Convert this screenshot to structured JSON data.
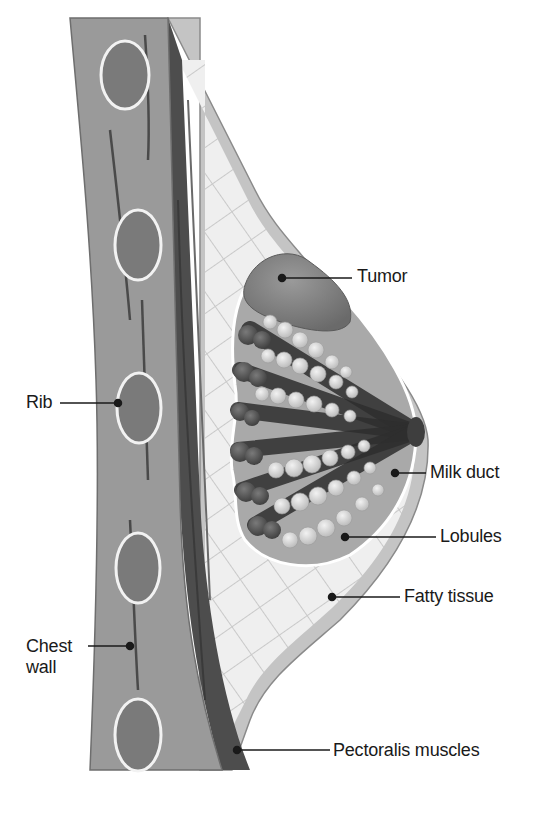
{
  "diagram": {
    "palette": {
      "background": "#ffffff",
      "chest_wall": "#9a9a9a",
      "chest_wall_edge": "#6e6e6e",
      "rib_fill": "#7a7a7a",
      "rib_outline": "#f2f2f2",
      "pectoralis": "#4d4d4d",
      "pectoralis_dark": "#3a3a3a",
      "fatty_tissue": "#ececec",
      "fatty_lines": "#c8c8c8",
      "skin": "#c4c4c4",
      "gland_bg": "#a9a9a9",
      "lobule_light": "#d9d9d9",
      "lobule_dark": "#5a5a5a",
      "duct_dark": "#2e2e2e",
      "tumor": "#808080",
      "nipple": "#3e3e3e",
      "leader_line": "#1a1a1a",
      "text": "#1a1a1a"
    },
    "labels": [
      {
        "id": "tumor",
        "text": "Tumor",
        "x": 357,
        "y": 258
      },
      {
        "id": "rib",
        "text": "Rib",
        "x": 26,
        "y": 397
      },
      {
        "id": "milk-duct",
        "text": "Milk duct",
        "x": 430,
        "y": 463
      },
      {
        "id": "lobules",
        "text": "Lobules",
        "x": 440,
        "y": 527
      },
      {
        "id": "fatty-tissue",
        "text": "Fatty tissue",
        "x": 404,
        "y": 590
      },
      {
        "id": "chest-wall",
        "text": "Chest wall",
        "x": 26,
        "y": 640
      },
      {
        "id": "pectoralis-muscles",
        "text": "Pectoralis muscles",
        "x": 333,
        "y": 746
      }
    ]
  }
}
